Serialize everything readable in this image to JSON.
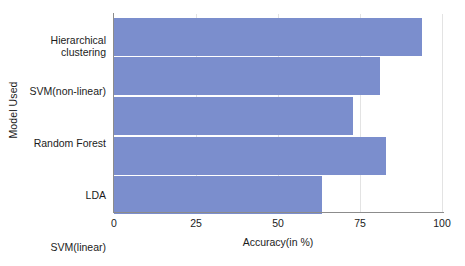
{
  "chart_data": {
    "type": "bar",
    "orientation": "horizontal",
    "title": "",
    "xlabel": "Accuracy(in %)",
    "ylabel": "Model Used",
    "categories": [
      "Hierarchical clustering",
      "SVM(non-linear)",
      "Random Forest",
      "LDA",
      "SVM(linear)"
    ],
    "values": [
      94,
      81,
      73,
      83,
      63.5
    ],
    "xlim": [
      0,
      100
    ],
    "xticks": [
      0,
      25,
      50,
      75,
      100
    ],
    "xtick_labels": [
      "0",
      "25",
      "50",
      "75",
      "100"
    ],
    "grid": "vertical-light",
    "legend": "none",
    "bar_color": "#7b8ecd",
    "axis_color": "#8c8c8c",
    "text_color": "#1b1b1b",
    "background": "#ffffff"
  },
  "axes": {
    "y_title": "Model Used",
    "x_title": "Accuracy(in %)"
  },
  "category_labels": {
    "0_line1": "Hierarchical",
    "0_line2": "clustering",
    "1": "SVM(non-linear)",
    "2": "Random Forest",
    "3": "LDA",
    "4": "SVM(linear)"
  },
  "x_ticks": {
    "0": "0",
    "1": "25",
    "2": "50",
    "3": "75",
    "4": "100"
  }
}
